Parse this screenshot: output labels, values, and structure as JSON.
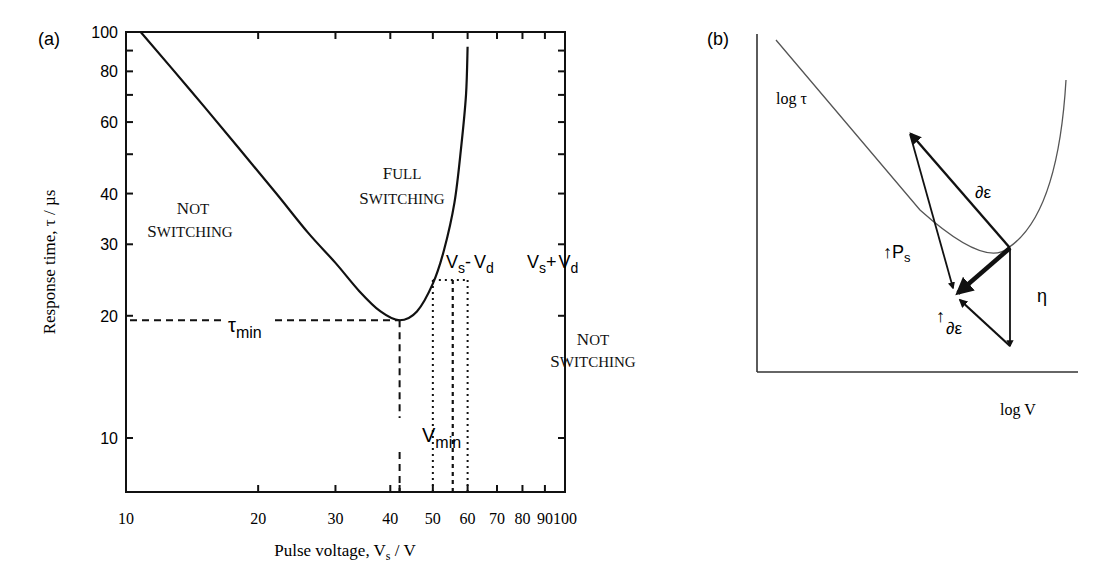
{
  "chart_data": [
    {
      "panel": "(a)",
      "type": "line",
      "title": "",
      "xlabel": "Pulse voltage, V_s / V",
      "ylabel": "Response time, τ / µs",
      "xscale": "log",
      "yscale": "log",
      "xlim": [
        10,
        100
      ],
      "ylim": [
        7.4,
        100
      ],
      "x_ticks": [
        10,
        20,
        30,
        40,
        50,
        60,
        70,
        80,
        90,
        100
      ],
      "y_ticks": [
        10,
        20,
        30,
        40,
        60,
        80,
        100
      ],
      "grid": false,
      "series": [
        {
          "name": "switching boundary (τ–V curve)",
          "x": [
            10.8,
            14,
            18,
            22,
            26,
            30,
            34,
            38,
            42,
            46,
            50,
            53,
            56,
            58,
            59.5,
            60
          ],
          "y": [
            100,
            72,
            52,
            40,
            32,
            27,
            23,
            20.5,
            19.5,
            20.5,
            24,
            29,
            38,
            52,
            70,
            92
          ]
        }
      ],
      "annotations": [
        {
          "text": "FULL SWITCHING",
          "x": 38,
          "y": 45
        },
        {
          "text": "NOT SWITCHING",
          "x": 14,
          "y": 36
        },
        {
          "text": "NOT SWITCHING",
          "x": 80,
          "y": 17
        },
        {
          "text": "τ_min",
          "x": 20,
          "y": 19.5,
          "note": "dashed horizontal line at τ_min ≈ 19.5"
        },
        {
          "text": "V_min",
          "x": 42,
          "y": 10,
          "note": "dashed vertical line at V_min ≈ 42"
        },
        {
          "text": "V_s - V_d",
          "x": 50,
          "y": 26,
          "note": "dotted vertical line at ≈ 50"
        },
        {
          "text": "V_s + V_d",
          "x": 60,
          "y": 26,
          "note": "dotted vertical line at ≈ 60"
        },
        {
          "text": "V_s",
          "x": 55.5,
          "y": 24.5,
          "note": "dashed vertical line at ≈ 55.5, dotted box top ≈ 24.5"
        }
      ],
      "min_point": {
        "V_min": 42,
        "tau_min": 19.5
      }
    },
    {
      "panel": "(b)",
      "type": "diagram",
      "xlabel": "log V",
      "ylabel": "log τ",
      "series": [
        {
          "name": "τ–V curve (schematic)",
          "shape": "U-shaped, linear descent then sharp rise"
        }
      ],
      "annotations": [
        {
          "text": "∂ε",
          "note": "vector from minimum up-left"
        },
        {
          "text": "↑P_s",
          "note": "increase in spontaneous polarisation"
        },
        {
          "text": "η",
          "note": "vertical vector downward (viscosity)"
        },
        {
          "text": "↑∂ε",
          "note": "increase in dielectric anisotropy"
        }
      ]
    }
  ],
  "labels": {
    "panel_a": "(a)",
    "panel_b": "(b)",
    "a_xlabel_main": "Pulse voltage, V",
    "a_xlabel_sub": "s",
    "a_xlabel_unit": " / V",
    "a_ylabel": "Response time, τ / µs",
    "full": "FULL",
    "switching": "SWITCHING",
    "not": "NOT",
    "tau": "τ",
    "min": "min",
    "V": "V",
    "s": "s",
    "d": "d",
    "minus": "-",
    "plus": "+",
    "b_ylabel": "log τ",
    "b_xlabel": "log V",
    "d_eps": "∂ε",
    "up_arrow": "↑",
    "P": "P",
    "eta": "η"
  },
  "x_tick_labels": [
    "10",
    "20",
    "30",
    "40",
    "50",
    "60",
    "70",
    "80",
    "90",
    "100"
  ],
  "y_tick_labels": [
    "100",
    "80",
    "60",
    "40",
    "30",
    "20",
    "10"
  ],
  "colors": {
    "ink": "#111111",
    "thin_curve": "#555555",
    "background": "#ffffff"
  }
}
